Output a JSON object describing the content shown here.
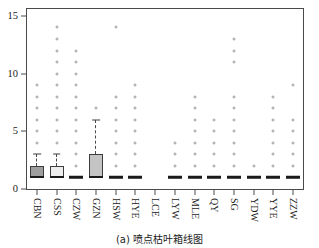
{
  "caption": "(a) 喷点枯叶箱线图",
  "chart_data": {
    "type": "box",
    "title": "",
    "xlabel": "",
    "ylabel": "",
    "ylim": [
      0,
      15.6
    ],
    "yticks": [
      0,
      5,
      10,
      15
    ],
    "ytick_labels": [
      "0",
      "5",
      "10",
      "15"
    ],
    "grid": false,
    "legend": "none",
    "categories": [
      "CBN",
      "CSS",
      "CZW",
      "GZN",
      "HSW",
      "HYE",
      "LCE",
      "LYW",
      "MLE",
      "QY",
      "SG",
      "YDW",
      "YYE",
      "ZZW"
    ],
    "boxes": [
      {
        "category": "CBN",
        "q1": 1,
        "median": 1,
        "q3": 2,
        "whisker_low": 1,
        "whisker_high": 3,
        "fill": "#9e9e9e",
        "outliers": [
          4,
          5,
          6,
          7,
          8,
          9
        ]
      },
      {
        "category": "CSS",
        "q1": 1,
        "median": 1,
        "q3": 2,
        "whisker_low": 1,
        "whisker_high": 3,
        "fill": "#ededed",
        "outliers": [
          4,
          5,
          6,
          7,
          8,
          9,
          10,
          11,
          12,
          13,
          14
        ]
      },
      {
        "category": "CZW",
        "q1": 1,
        "median": 1,
        "q3": 1,
        "whisker_low": 1,
        "whisker_high": 1,
        "fill": "#d9d9d9",
        "outliers": [
          2,
          3,
          4,
          5,
          6,
          7,
          8,
          9,
          10,
          11,
          12
        ]
      },
      {
        "category": "GZN",
        "q1": 1,
        "median": 1,
        "q3": 3,
        "whisker_low": 1,
        "whisker_high": 6,
        "fill": "#c4c4c4",
        "outliers": [
          7
        ]
      },
      {
        "category": "HSW",
        "q1": 1,
        "median": 1,
        "q3": 1,
        "whisker_low": 1,
        "whisker_high": 1,
        "fill": "#d9d9d9",
        "outliers": [
          2,
          3,
          4,
          5,
          6,
          7,
          8,
          14
        ]
      },
      {
        "category": "HYE",
        "q1": 1,
        "median": 1,
        "q3": 1,
        "whisker_low": 1,
        "whisker_high": 1,
        "fill": "#d9d9d9",
        "outliers": [
          2,
          3,
          4,
          5,
          6,
          7,
          8,
          9
        ]
      },
      {
        "category": "LCE",
        "q1": null,
        "median": null,
        "q3": null,
        "whisker_low": null,
        "whisker_high": null,
        "fill": "#d9d9d9",
        "outliers": []
      },
      {
        "category": "LYW",
        "q1": 1,
        "median": 1,
        "q3": 1,
        "whisker_low": 1,
        "whisker_high": 1,
        "fill": "#d9d9d9",
        "outliers": [
          2,
          3,
          4
        ]
      },
      {
        "category": "MLE",
        "q1": 1,
        "median": 1,
        "q3": 1,
        "whisker_low": 1,
        "whisker_high": 1,
        "fill": "#d9d9d9",
        "outliers": [
          2,
          3,
          4,
          5,
          6,
          7,
          8
        ]
      },
      {
        "category": "QY",
        "q1": 1,
        "median": 1,
        "q3": 1,
        "whisker_low": 1,
        "whisker_high": 1,
        "fill": "#d9d9d9",
        "outliers": [
          2,
          3,
          4,
          5,
          6
        ]
      },
      {
        "category": "SG",
        "q1": 1,
        "median": 1,
        "q3": 1,
        "whisker_low": 1,
        "whisker_high": 1,
        "fill": "#d9d9d9",
        "outliers": [
          2,
          3,
          4,
          5,
          6,
          7,
          8,
          11,
          12,
          13
        ]
      },
      {
        "category": "YDW",
        "q1": 1,
        "median": 1,
        "q3": 1,
        "whisker_low": 1,
        "whisker_high": 1,
        "fill": "#d9d9d9",
        "outliers": [
          2
        ]
      },
      {
        "category": "YYE",
        "q1": 1,
        "median": 1,
        "q3": 1,
        "whisker_low": 1,
        "whisker_high": 1,
        "fill": "#d9d9d9",
        "outliers": [
          2,
          3,
          4,
          5,
          6,
          7,
          8
        ]
      },
      {
        "category": "ZZW",
        "q1": 1,
        "median": 1,
        "q3": 1,
        "whisker_low": 1,
        "whisker_high": 1,
        "fill": "#d9d9d9",
        "outliers": [
          2,
          3,
          4,
          5,
          6,
          9
        ]
      }
    ]
  }
}
